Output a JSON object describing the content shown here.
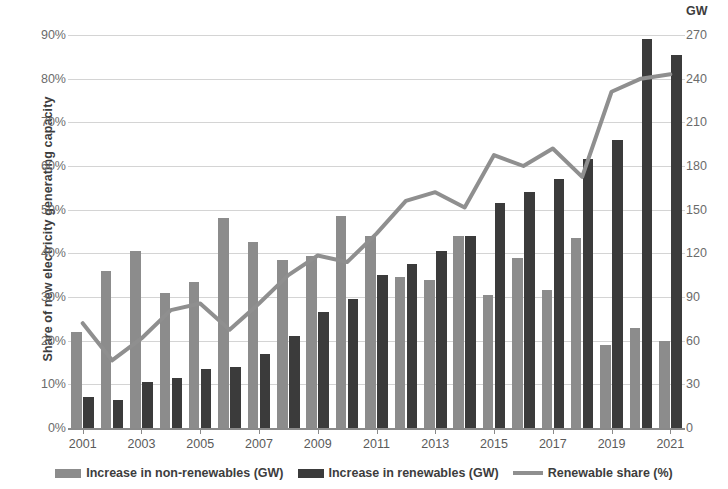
{
  "chart_data": {
    "type": "bar",
    "title": "",
    "subtitle": "",
    "xlabel": "",
    "ylabel": "Share of new electricity generating capacity",
    "y2label": "GW",
    "grid": true,
    "legend_position": "bottom",
    "categories": [
      "2001",
      "2002",
      "2003",
      "2004",
      "2005",
      "2006",
      "2007",
      "2008",
      "2009",
      "2010",
      "2011",
      "2012",
      "2013",
      "2014",
      "2015",
      "2016",
      "2017",
      "2018",
      "2019",
      "2020",
      "2021"
    ],
    "x_tick_labels": [
      "2001",
      "2003",
      "2005",
      "2007",
      "2009",
      "2011",
      "2013",
      "2015",
      "2017",
      "2019",
      "2021"
    ],
    "ylim": [
      0,
      90
    ],
    "y_tick_labels": [
      "0%",
      "10%",
      "20%",
      "30%",
      "40%",
      "50%",
      "60%",
      "70%",
      "80%",
      "90%"
    ],
    "y_ticks": [
      0,
      10,
      20,
      30,
      40,
      50,
      60,
      70,
      80,
      90
    ],
    "y2lim": [
      0,
      270
    ],
    "y2_tick_labels": [
      "0",
      "30",
      "60",
      "90",
      "120",
      "150",
      "180",
      "210",
      "240",
      "270"
    ],
    "y2_ticks": [
      0,
      30,
      60,
      90,
      120,
      150,
      180,
      210,
      240,
      270
    ],
    "series": [
      {
        "name": "Increase in non-renewables (GW)",
        "type": "bar",
        "axis": "right",
        "color": "#8c8c8c",
        "values_pct_scale": [
          22,
          36,
          40.5,
          31,
          33.5,
          48,
          42.5,
          38.5,
          39.5,
          48.5,
          44,
          34.5,
          34,
          44,
          30.5,
          39,
          31.5,
          43.5,
          19,
          23,
          20
        ],
        "values_gw": [
          66,
          108,
          121,
          93,
          101,
          145,
          128,
          115,
          119,
          146,
          132,
          104,
          102,
          132,
          92,
          117,
          95,
          131,
          57,
          69,
          60
        ]
      },
      {
        "name": "Increase in renewables (GW)",
        "type": "bar",
        "axis": "right",
        "color": "#3b3b3b",
        "values_pct_scale": [
          7,
          6.5,
          10.5,
          11.5,
          13.5,
          14,
          17,
          21,
          26.5,
          29.5,
          35,
          37.5,
          40.5,
          44,
          51.5,
          54,
          57,
          61.5,
          66,
          89,
          85.5
        ],
        "values_gw": [
          21,
          20,
          32,
          35,
          41,
          42,
          51,
          63,
          80,
          89,
          105,
          113,
          122,
          132,
          155,
          162,
          171,
          185,
          198,
          267,
          257
        ]
      },
      {
        "name": "Renewable share (%)",
        "type": "line",
        "axis": "left",
        "color": "#8f8f8f",
        "values": [
          24,
          15.5,
          20.5,
          27,
          28.5,
          22.5,
          28.5,
          35,
          39.5,
          38,
          44.5,
          52,
          54,
          50.5,
          62.5,
          60,
          64,
          57.5,
          77,
          80,
          81
        ]
      }
    ]
  },
  "legend": {
    "items": [
      {
        "label": "Increase in non-renewables (GW)",
        "marker": "bar",
        "color": "#8c8c8c"
      },
      {
        "label": "Increase in renewables (GW)",
        "marker": "bar",
        "color": "#3b3b3b"
      },
      {
        "label": "Renewable share (%)",
        "marker": "line",
        "color": "#8f8f8f"
      }
    ]
  }
}
